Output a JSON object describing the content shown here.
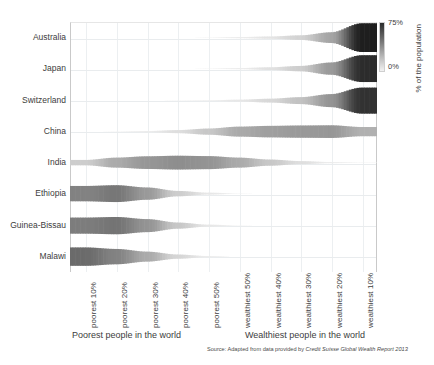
{
  "chart_data": {
    "type": "heatmap",
    "title": "",
    "subtitle": "",
    "xlabel_left": "Poorest people in the world",
    "xlabel_right": "Wealthiest people in the world",
    "ylabel": "",
    "colorbar_label": "% of the population",
    "colorbar_ticks": [
      "75%",
      "0%"
    ],
    "colorbar_range": [
      0,
      75
    ],
    "source": "Source: Adapted from data provided by Credit Suisse Global Wealth Report 2013",
    "grid": true,
    "legend_position": "right",
    "categories": [
      "poorest 10%",
      "poorest 20%",
      "poorest 30%",
      "poorest 40%",
      "poorest 50%",
      "wealthiest 50%",
      "wealthiest 40%",
      "wealthiest 30%",
      "wealthiest 20%",
      "wealthiest 10%"
    ],
    "series": [
      {
        "name": "Australia",
        "values": [
          0,
          0,
          0,
          0,
          1,
          3,
          6,
          12,
          28,
          75
        ]
      },
      {
        "name": "Japan",
        "values": [
          0,
          0,
          0,
          0,
          1,
          3,
          7,
          14,
          32,
          70
        ]
      },
      {
        "name": "Switzerland",
        "values": [
          0,
          0,
          0,
          1,
          2,
          5,
          10,
          18,
          34,
          68
        ]
      },
      {
        "name": "China",
        "values": [
          0,
          1,
          3,
          8,
          16,
          26,
          30,
          32,
          33,
          24
        ]
      },
      {
        "name": "India",
        "values": [
          14,
          26,
          33,
          36,
          34,
          26,
          16,
          8,
          3,
          1
        ]
      },
      {
        "name": "Ethiopia",
        "values": [
          40,
          44,
          32,
          14,
          5,
          1,
          0,
          0,
          0,
          0
        ]
      },
      {
        "name": "Guinea-Bissau",
        "values": [
          42,
          45,
          34,
          16,
          5,
          1,
          0,
          0,
          0,
          0
        ]
      },
      {
        "name": "Malawi",
        "values": [
          48,
          40,
          26,
          11,
          3,
          0,
          0,
          0,
          0,
          0
        ]
      }
    ]
  },
  "axis": {
    "y_categories": [
      "Australia",
      "Japan",
      "Switzerland",
      "China",
      "India",
      "Ethiopia",
      "Guinea-Bissau",
      "Malawi"
    ],
    "x_categories": [
      "poorest 10%",
      "poorest 20%",
      "poorest 30%",
      "poorest 40%",
      "poorest 50%",
      "wealthiest 50%",
      "wealthiest 40%",
      "wealthiest 30%",
      "wealthiest 20%",
      "wealthiest 10%"
    ]
  },
  "captions": {
    "left": "Poorest people in the world",
    "right": "Wealthiest people in the world",
    "source_prefix": "Source: Adapted from data provided by ",
    "source_italic": "Credit Suisse Global Wealth Report 2013"
  },
  "legend": {
    "top_tick": "75%",
    "bottom_tick": "0%",
    "title": "% of the population"
  },
  "colors": {
    "ink": "#3a3a3a",
    "grid": "#eceff1",
    "axis": "#c9c9c9",
    "ribbon_dark": "#2b2b2b",
    "ribbon_light": "#ededed",
    "background": "#ffffff"
  }
}
